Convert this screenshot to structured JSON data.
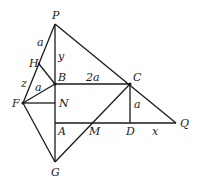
{
  "diagram": {
    "type": "geometry",
    "points": {
      "P": {
        "label": "P",
        "x": 55,
        "y": 24
      },
      "H": {
        "label": "H",
        "x": 39,
        "y": 64
      },
      "B": {
        "label": "B",
        "x": 55,
        "y": 84
      },
      "C": {
        "label": "C",
        "x": 130,
        "y": 84
      },
      "F": {
        "label": "F",
        "x": 23,
        "y": 103
      },
      "N": {
        "label": "N",
        "x": 55,
        "y": 103
      },
      "A": {
        "label": "A",
        "x": 55,
        "y": 123
      },
      "M": {
        "label": "M",
        "x": 92,
        "y": 123
      },
      "D": {
        "label": "D",
        "x": 130,
        "y": 123
      },
      "Q": {
        "label": "Q",
        "x": 176,
        "y": 123
      },
      "G": {
        "label": "G",
        "x": 55,
        "y": 162
      }
    },
    "segment_labels": {
      "PH": "a",
      "PB": "y",
      "HF": "z",
      "FB": "a",
      "BC": "2a",
      "CD": "a",
      "DQ": "x"
    }
  }
}
